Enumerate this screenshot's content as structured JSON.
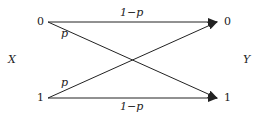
{
  "diagram": {
    "input_label": "X",
    "output_label": "Y",
    "input_symbols": [
      "0",
      "1"
    ],
    "output_symbols": [
      "0",
      "1"
    ],
    "edges": [
      {
        "from": "0",
        "to": "0",
        "label": "1−p"
      },
      {
        "from": "0",
        "to": "1",
        "label": "p"
      },
      {
        "from": "1",
        "to": "0",
        "label": "p"
      },
      {
        "from": "1",
        "to": "1",
        "label": "1−p"
      }
    ],
    "colors": {
      "line": "#222222",
      "background": "#ffffff"
    }
  }
}
